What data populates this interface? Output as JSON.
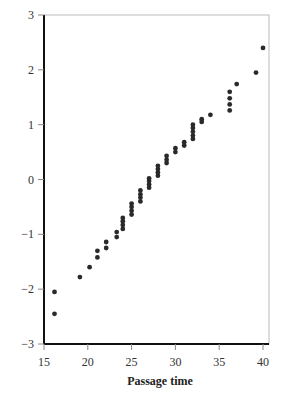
{
  "chart_data": {
    "type": "scatter",
    "title": "",
    "xlabel": "Passage time",
    "ylabel": "",
    "xlim": [
      15,
      40.5
    ],
    "ylim": [
      -3,
      3
    ],
    "xticks": [
      15,
      20,
      25,
      30,
      35,
      40
    ],
    "yticks": [
      -3,
      -2,
      -1,
      0,
      1,
      2,
      3
    ],
    "xtick_labels": [
      "15",
      "20",
      "25",
      "30",
      "35",
      "40"
    ],
    "ytick_labels": [
      "−3",
      "−2",
      "−1",
      "0",
      "1",
      "2",
      "3"
    ],
    "grid": false,
    "legend": null,
    "point_color": "#2a2a2a",
    "series": [
      {
        "name": "normal scores",
        "points": [
          [
            16.2,
            -2.45
          ],
          [
            16.2,
            -2.05
          ],
          [
            19.1,
            -1.78
          ],
          [
            20.2,
            -1.6
          ],
          [
            21.1,
            -1.42
          ],
          [
            21.1,
            -1.3
          ],
          [
            22.1,
            -1.25
          ],
          [
            22.1,
            -1.14
          ],
          [
            23.3,
            -1.05
          ],
          [
            23.3,
            -0.96
          ],
          [
            24.0,
            -0.9
          ],
          [
            24.0,
            -0.83
          ],
          [
            24.0,
            -0.76
          ],
          [
            24.0,
            -0.7
          ],
          [
            25.0,
            -0.64
          ],
          [
            25.0,
            -0.57
          ],
          [
            25.0,
            -0.5
          ],
          [
            25.0,
            -0.44
          ],
          [
            26.0,
            -0.4
          ],
          [
            26.0,
            -0.33
          ],
          [
            26.0,
            -0.27
          ],
          [
            26.0,
            -0.2
          ],
          [
            27.0,
            -0.15
          ],
          [
            27.0,
            -0.09
          ],
          [
            27.0,
            -0.03
          ],
          [
            27.0,
            0.02
          ],
          [
            28.0,
            0.07
          ],
          [
            28.0,
            0.13
          ],
          [
            28.0,
            0.19
          ],
          [
            28.0,
            0.25
          ],
          [
            29.0,
            0.3
          ],
          [
            29.0,
            0.36
          ],
          [
            29.0,
            0.43
          ],
          [
            30.0,
            0.5
          ],
          [
            30.0,
            0.57
          ],
          [
            31.0,
            0.62
          ],
          [
            31.0,
            0.68
          ],
          [
            32.0,
            0.74
          ],
          [
            32.0,
            0.8
          ],
          [
            32.0,
            0.87
          ],
          [
            32.0,
            0.94
          ],
          [
            32.0,
            1.0
          ],
          [
            33.0,
            1.05
          ],
          [
            33.0,
            1.1
          ],
          [
            34.0,
            1.18
          ],
          [
            36.2,
            1.26
          ],
          [
            36.2,
            1.37
          ],
          [
            36.2,
            1.48
          ],
          [
            36.2,
            1.6
          ],
          [
            37.0,
            1.74
          ],
          [
            39.2,
            1.95
          ],
          [
            40.0,
            2.4
          ]
        ]
      }
    ]
  }
}
